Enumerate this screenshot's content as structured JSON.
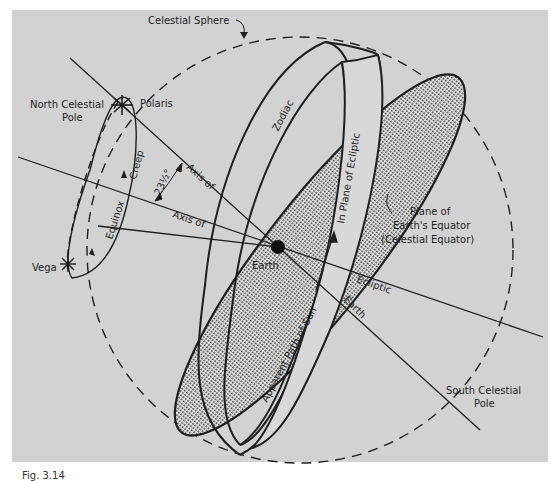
{
  "figure": {
    "background": "#d2d2d2",
    "ink": "#1e1e1e",
    "caption_partial": "Fig. 3.14"
  },
  "labels": {
    "celestial_sphere": "Celestial Sphere",
    "north_celestial_pole_1": "North Celestial",
    "north_celestial_pole_2": "Pole",
    "polaris": "Polaris",
    "vega": "Vega",
    "creep": "Creep",
    "equinox": "Equinox",
    "angle": "23½°",
    "axis_of_1": "Axis of",
    "axis_of_2": "Axis of",
    "zodiac": "Zodiac",
    "in_plane_of_ecliptic": "In Plane of Ecliptic",
    "plane_of_equator_1": "Plane of",
    "plane_of_equator_2": "Earth's Equator",
    "plane_of_equator_3": "(Celestial Equator)",
    "earth": "Earth",
    "apparent_path_of_sun": "Apparent Path of Sun",
    "ecliptic": "Ecliptic",
    "earth_axis": "Earth",
    "south_celestial_pole_1": "South Celestial",
    "south_celestial_pole_2": "Pole"
  }
}
